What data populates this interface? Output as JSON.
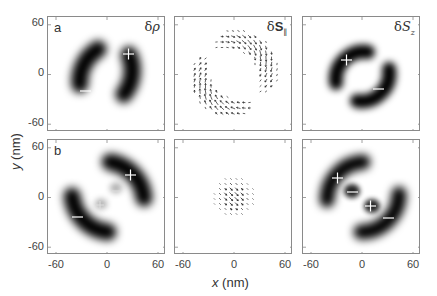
{
  "chart_data": {
    "type": "heatmap",
    "title": "",
    "xlabel": "x (nm)",
    "ylabel": "y (nm)",
    "xlim": [
      -70,
      70
    ],
    "ylim": [
      -70,
      70
    ],
    "xticks": [
      "-60",
      "0",
      "60"
    ],
    "yticks": [
      "60",
      "0",
      "-60"
    ],
    "rows": [
      {
        "row_label": "a",
        "panels": [
          {
            "quantity": "δρ",
            "kind": "density",
            "lobes": [
              {
                "sign": "+",
                "center_nm": [
                  25,
                  25
                ]
              },
              {
                "sign": "−",
                "center_nm": [
                  -25,
                  -25
                ]
              }
            ]
          },
          {
            "quantity": "δS∥",
            "kind": "vector-field",
            "description": "in-plane spin texture on two crescents around a ring of radius ~35 nm"
          },
          {
            "quantity": "δSz",
            "kind": "density",
            "lobes": [
              {
                "sign": "+",
                "center_nm": [
                  -25,
                  25
                ]
              },
              {
                "sign": "−",
                "center_nm": [
                  25,
                  -25
                ]
              }
            ]
          }
        ]
      },
      {
        "row_label": "b",
        "panels": [
          {
            "quantity": "δρ",
            "kind": "density",
            "lobes": [
              {
                "sign": "+",
                "center_nm": [
                  28,
                  28
                ]
              },
              {
                "sign": "−",
                "center_nm": [
                  -32,
                  -32
                ]
              },
              {
                "sign": "−",
                "center_nm": [
                  8,
                  8
                ]
              },
              {
                "sign": "+",
                "center_nm": [
                  -8,
                  -8
                ]
              }
            ]
          },
          {
            "quantity": "δS∥",
            "kind": "vector-field",
            "description": "small central disk of diagonal arrows, radius ~20 nm"
          },
          {
            "quantity": "δSz",
            "kind": "density",
            "lobes": [
              {
                "sign": "+",
                "center_nm": [
                  -30,
                  30
                ]
              },
              {
                "sign": "−",
                "center_nm": [
                  -8,
                  8
                ]
              },
              {
                "sign": "+",
                "center_nm": [
                  8,
                  -8
                ]
              },
              {
                "sign": "−",
                "center_nm": [
                  32,
                  -22
                ]
              }
            ]
          }
        ]
      }
    ]
  },
  "labels": {
    "row_a": "a",
    "row_b": "b",
    "delta": "δ",
    "rho": "ρ",
    "S_bold": "S",
    "S_italic": "S",
    "par_sub": "∥",
    "z_sub": "z",
    "y_axis": "y",
    "x_axis": "x",
    "unit": " (nm)",
    "tick_60": "60",
    "tick_0": "0",
    "tick_m60": "-60"
  }
}
